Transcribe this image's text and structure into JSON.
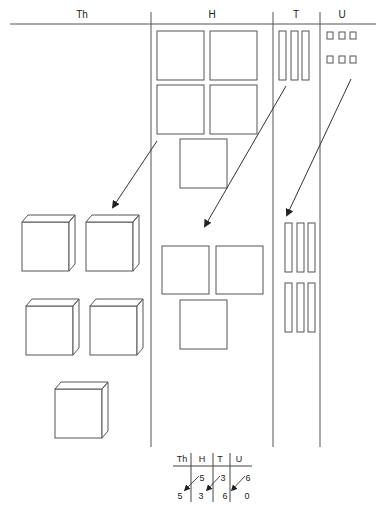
{
  "place_value_chart": {
    "headers": [
      "Th",
      "H",
      "T",
      "U"
    ],
    "columns": {
      "thousands": {
        "label": "Th",
        "blocks_after_regroup": 5
      },
      "hundreds": {
        "label": "H",
        "blocks_initial": 5,
        "blocks_after_regroup": 3
      },
      "tens": {
        "label": "T",
        "rods_initial": 3,
        "rods_after_regroup": 6
      },
      "units": {
        "label": "U",
        "cubes_initial": 6,
        "cubes_after_regroup": 0
      }
    }
  },
  "summary_table": {
    "headers": [
      "Th",
      "H",
      "T",
      "U"
    ],
    "top_row": [
      "",
      "5",
      "3",
      "6"
    ],
    "bottom_row": [
      "5",
      "3",
      "6",
      "0"
    ]
  },
  "colors": {
    "line": "#444444",
    "text": "#222222",
    "background": "#ffffff"
  }
}
